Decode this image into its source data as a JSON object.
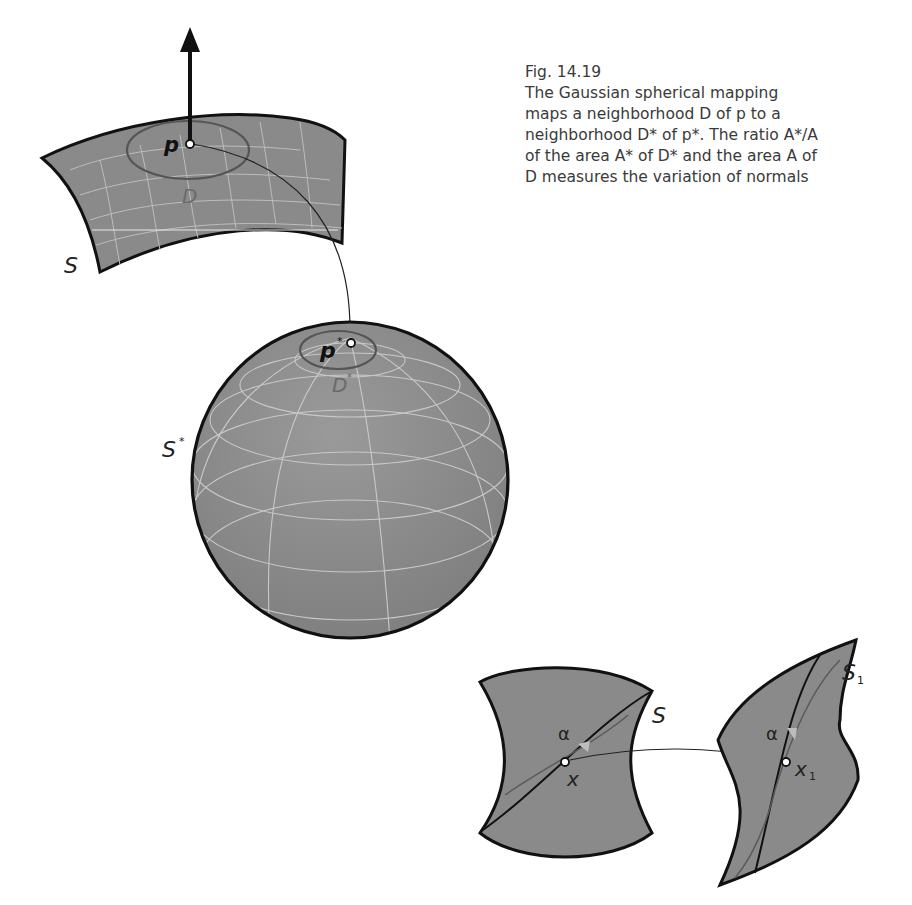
{
  "caption": {
    "fig_number": "Fig. 14.19",
    "lines": [
      "The Gaussian spherical mapping",
      "maps a neighborhood D of p to a",
      "neighborhood D* of p*. The ratio A*/A",
      "of the area A* of D* and the area A of",
      "D measures the variation of normals"
    ]
  },
  "labels": {
    "surface": "S",
    "point": "p",
    "neighborhood": "D",
    "sphere": "S",
    "sphere_sup": "*",
    "image_point": "p",
    "image_point_sup": "*",
    "image_neighborhood": "D",
    "image_neighborhood_sup": "*",
    "hyperboloid": "S",
    "hyp_point": "x",
    "hyp_angle": "α",
    "mapped_surface": "S",
    "mapped_surface_sub": "1",
    "mapped_point": "x",
    "mapped_point_sub": "1",
    "mapped_angle": "α"
  },
  "colors": {
    "surface_fill": "#8a8a8a",
    "outline": "#111111",
    "grid": "#c4c4c4",
    "neighborhood_outline": "#555555",
    "label_dim": "#6a6a6a",
    "caption_text": "#3a3a3a"
  }
}
